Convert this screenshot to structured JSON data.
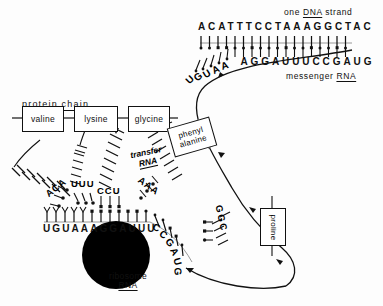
{
  "headers": {
    "dna_prefix": "one",
    "dna_word": "DNA",
    "dna_suffix": "strand",
    "mrna_prefix": "messenger",
    "mrna_word": "RNA"
  },
  "sequences": {
    "dna_strand": "ACATTTCCTAAAGGCTAC",
    "messenger_rna_top": "UGUAAAGGAUUUCCGAUG",
    "ribosome_mrna": "UGUAAAGGAUUUCCGAUG"
  },
  "protein_chain": {
    "label": "protein chain",
    "residues": [
      {
        "name": "valine"
      },
      {
        "name": "lysine"
      },
      {
        "name": "glycine"
      }
    ]
  },
  "incoming_amino_acids": [
    {
      "name": "phenyl alanine",
      "line1": "phenyl",
      "line2": "alanine"
    },
    {
      "name": "proline",
      "line1": "proline"
    }
  ],
  "labels": {
    "transfer_rna_line1": "transfer",
    "transfer_rna_line2": "RNA",
    "ribosome_line1": "ribosome",
    "ribosome_line2": "RNA"
  },
  "anticodons": [
    {
      "codon": "ACA",
      "pairs_with": "UGU",
      "amino_acid": "valine"
    },
    {
      "codon": "UUU",
      "pairs_with": "AAA",
      "amino_acid": "lysine"
    },
    {
      "codon": "CCU",
      "pairs_with": "GGA",
      "amino_acid": "glycine"
    },
    {
      "codon": "AAA",
      "pairs_with": "UUU",
      "amino_acid": "phenyl alanine"
    },
    {
      "codon": "GGC",
      "pairs_with": "CCG",
      "amino_acid": "proline"
    }
  ],
  "colors": {
    "ink": "#111111",
    "paper": "#fdfdfd",
    "ribosome": "#000000"
  }
}
